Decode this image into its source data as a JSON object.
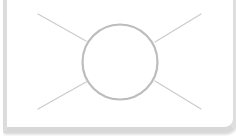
{
  "placeholder": {
    "type": "image-placeholder",
    "icon": "broken-image-placeholder-icon",
    "colors": {
      "background": "#ffffff",
      "border": "#dcdcdc",
      "stroke": "#c8c8c8"
    }
  }
}
